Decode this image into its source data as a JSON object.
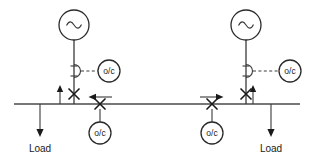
{
  "diagram": {
    "canvas": {
      "width": 314,
      "height": 161
    },
    "colors": {
      "line": "#3a3a3a",
      "bus": "#4a4a4a",
      "symbol_outline": "#2a2a2a",
      "text": "#1a1a1a",
      "background": "#ffffff"
    },
    "bus": {
      "label": "",
      "y": 104,
      "x_start": 14,
      "x_end": 300
    },
    "sources": [
      {
        "id": "source-left",
        "symbol": "ac-source",
        "label": "~",
        "cx": 74,
        "cy": 25,
        "r": 15
      },
      {
        "id": "source-right",
        "symbol": "ac-source",
        "label": "~",
        "cx": 246,
        "cy": 25,
        "r": 15
      }
    ],
    "cts": [
      {
        "id": "ct-left",
        "x": 74,
        "y": 71
      },
      {
        "id": "ct-right",
        "x": 246,
        "y": 71
      }
    ],
    "relays": [
      {
        "id": "relay-feeder-left",
        "label": "o/c",
        "cx": 109,
        "cy": 71,
        "r": 11,
        "type": "overcurrent"
      },
      {
        "id": "relay-feeder-right",
        "label": "o/c",
        "cx": 290,
        "cy": 71,
        "r": 11,
        "type": "overcurrent"
      },
      {
        "id": "relay-tie-left",
        "label": "o/c",
        "cx": 100,
        "cy": 133,
        "r": 11,
        "type": "directional-overcurrent"
      },
      {
        "id": "relay-tie-right",
        "label": "o/c",
        "cx": 212,
        "cy": 133,
        "r": 11,
        "type": "directional-overcurrent"
      }
    ],
    "breakers": [
      {
        "id": "breaker-source-left",
        "symbol": "x-breaker",
        "x": 74,
        "y": 94
      },
      {
        "id": "breaker-source-right",
        "symbol": "x-breaker",
        "x": 246,
        "y": 94
      },
      {
        "id": "breaker-tie-left",
        "symbol": "x-breaker",
        "x": 100,
        "y": 104
      },
      {
        "id": "breaker-tie-right",
        "symbol": "x-breaker",
        "x": 212,
        "y": 104
      }
    ],
    "direction_arrows": [
      {
        "id": "direction-arrow-left",
        "direction": "left",
        "x": 100,
        "y": 97
      },
      {
        "id": "direction-arrow-right",
        "direction": "right",
        "x": 212,
        "y": 97
      }
    ],
    "ct_arrows": [
      {
        "id": "ct-arrow-load-left",
        "direction": "up",
        "x": 60,
        "y": 104
      },
      {
        "id": "ct-arrow-load-right",
        "direction": "up",
        "x": 253,
        "y": 104
      }
    ],
    "loads": [
      {
        "id": "load-left",
        "label": "Load",
        "x": 40,
        "y_top": 104,
        "y_bottom": 136
      },
      {
        "id": "load-right",
        "label": "Load",
        "x": 271,
        "y_top": 104,
        "y_bottom": 136
      }
    ],
    "labels": {
      "load": "Load",
      "overcurrent_relay": "o/c",
      "ac_source": "~"
    }
  }
}
